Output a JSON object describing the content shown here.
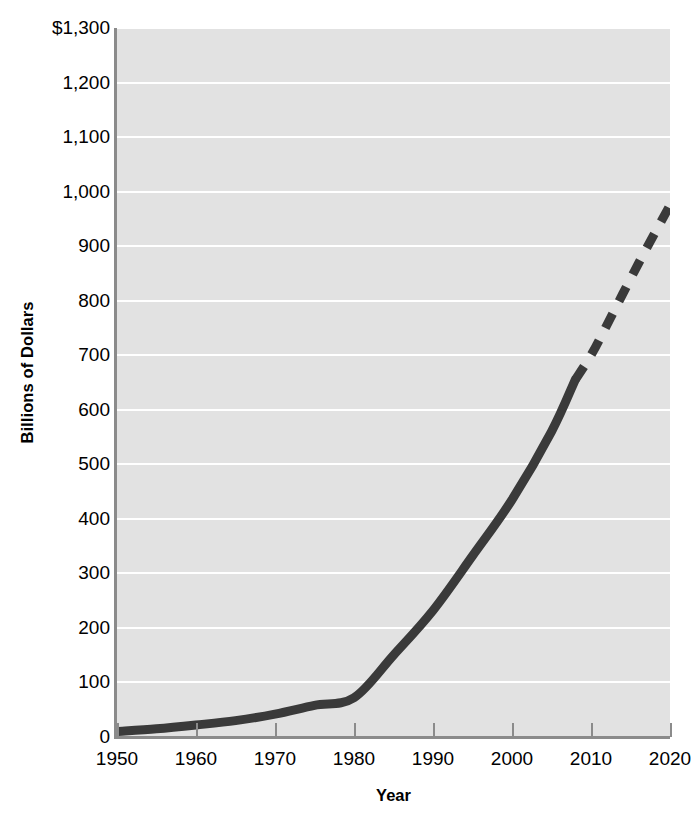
{
  "chart_data": {
    "type": "line",
    "title": "",
    "xlabel": "Year",
    "ylabel": "Billions of Dollars",
    "xlim": [
      1950,
      2020
    ],
    "ylim": [
      0,
      1300
    ],
    "grid": true,
    "legend": "none",
    "x_tick_labels": [
      "1950",
      "1960",
      "1970",
      "1980",
      "1990",
      "2000",
      "2010",
      "2020"
    ],
    "x_ticks": [
      1950,
      1960,
      1970,
      1980,
      1990,
      2000,
      2010,
      2020
    ],
    "y_tick_labels": [
      "$1,300",
      "1,200",
      "1,100",
      "1,000",
      "900",
      "800",
      "700",
      "600",
      "500",
      "400",
      "300",
      "200",
      "100",
      "0"
    ],
    "y_ticks": [
      1300,
      1200,
      1100,
      1000,
      900,
      800,
      700,
      600,
      500,
      400,
      300,
      200,
      100,
      0
    ],
    "series": [
      {
        "name": "Actual",
        "style": "solid",
        "color": "#3a3a3a",
        "x": [
          1950,
          1955,
          1960,
          1965,
          1970,
          1975,
          1980,
          1985,
          1990,
          1995,
          2000,
          2005,
          2008
        ],
        "values": [
          10,
          15,
          22,
          30,
          42,
          58,
          72,
          150,
          232,
          332,
          435,
          560,
          655
        ]
      },
      {
        "name": "Projected",
        "style": "dashed",
        "color": "#3a3a3a",
        "x": [
          2008,
          2010,
          2012,
          2014,
          2016,
          2018,
          2020
        ],
        "values": [
          655,
          700,
          755,
          812,
          868,
          922,
          975
        ]
      }
    ]
  },
  "axes": {
    "y_title": "Billions of Dollars",
    "x_title": "Year"
  },
  "colors": {
    "plot_background": "#e2e2e2",
    "gridline": "#ffffff",
    "axis": "#8b8b8b",
    "series": "#3a3a3a",
    "text": "#000000",
    "page_background": "#ffffff"
  }
}
